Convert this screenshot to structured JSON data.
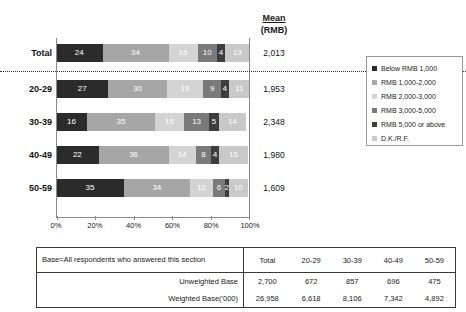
{
  "mean_header": {
    "word": "Mean",
    "unit": "(RMB)"
  },
  "chart_data": {
    "type": "bar",
    "title": "",
    "subtitle": "",
    "xlabel": "",
    "ylabel": "",
    "orientation": "horizontal",
    "stacked": true,
    "stack_percent": true,
    "xlim": [
      0,
      100
    ],
    "xticks": [
      "0%",
      "20%",
      "40%",
      "60%",
      "80%",
      "100%"
    ],
    "grid": false,
    "legend_position": "right",
    "categories": [
      "Total",
      "20-29",
      "30-39",
      "40-49",
      "50-59"
    ],
    "series": [
      {
        "name": "Below RMB 1,000",
        "color": "#2b2b2b",
        "label_color": "#ffffff",
        "values": [
          24,
          27,
          16,
          22,
          35
        ]
      },
      {
        "name": "RMB 1,000-2,000",
        "color": "#a6a6a6",
        "label_color": "#ffffff",
        "values": [
          34,
          30,
          35,
          36,
          34
        ]
      },
      {
        "name": "RMB 2,000-3,000",
        "color": "#d4d4d4",
        "label_color": "#ffffff",
        "values": [
          15,
          19,
          15,
          14,
          12
        ]
      },
      {
        "name": "RMB 3,000-5,000",
        "color": "#7a7a7a",
        "label_color": "#ffffff",
        "values": [
          10,
          9,
          13,
          8,
          6
        ]
      },
      {
        "name": "RMB 5,000 or above",
        "color": "#3d3d3d",
        "label_color": "#ffffff",
        "values": [
          4,
          4,
          5,
          4,
          2
        ]
      },
      {
        "name": "D.K./R.F.",
        "color": "#c9c9c9",
        "label_color": "#ffffff",
        "values": [
          13,
          11,
          14,
          15,
          10
        ]
      }
    ],
    "annotations": {
      "mean_column_header": "Mean (RMB)",
      "mean_values": [
        "2,013",
        "1,953",
        "2,348",
        "1,980",
        "1,609"
      ]
    }
  },
  "legend": {
    "items": [
      {
        "label": "Below RMB 1,000",
        "color": "#2b2b2b"
      },
      {
        "label": "RMB 1,000-2,000",
        "color": "#a6a6a6"
      },
      {
        "label": "RMB 2,000-3,000",
        "color": "#d4d4d4"
      },
      {
        "label": "RMB 3,000-5,000",
        "color": "#7a7a7a"
      },
      {
        "label": "RMB 5,000 or above",
        "color": "#3d3d3d"
      },
      {
        "label": "D.K./R.F.",
        "color": "#c9c9c9"
      }
    ]
  },
  "base_table": {
    "description": "Base=All respondents who answered this section",
    "columns": [
      "Total",
      "20-29",
      "30-39",
      "40-49",
      "50-59"
    ],
    "rows": [
      {
        "label": "Unweighted Base",
        "values": [
          "2,700",
          "672",
          "857",
          "696",
          "475"
        ]
      },
      {
        "label": "Weighted Base('000)",
        "values": [
          "26,958",
          "6,618",
          "8,106",
          "7,342",
          "4,892"
        ]
      }
    ]
  }
}
